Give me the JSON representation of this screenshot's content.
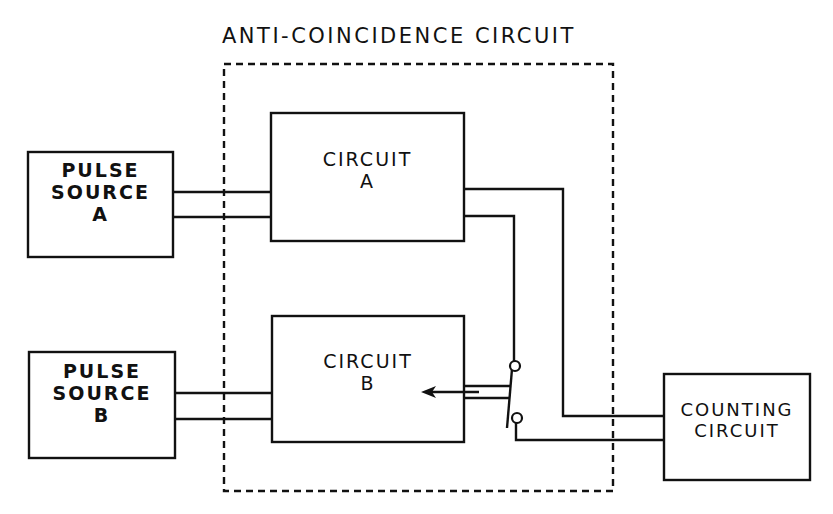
{
  "diagram": {
    "title": "ANTI-COINCIDENCE CIRCUIT",
    "blocks": {
      "pulse_source_a": {
        "line1": "PULSE",
        "line2": "SOURCE",
        "line3": "A"
      },
      "pulse_source_b": {
        "line1": "PULSE",
        "line2": "SOURCE",
        "line3": "B"
      },
      "circuit_a": {
        "line1": "CIRCUIT",
        "line2": "A"
      },
      "circuit_b": {
        "line1": "CIRCUIT",
        "line2": "B"
      },
      "counting_circuit": {
        "line1": "COUNTING",
        "line2": "CIRCUIT"
      }
    },
    "colors": {
      "ink": "#111111",
      "background": "#ffffff"
    }
  }
}
